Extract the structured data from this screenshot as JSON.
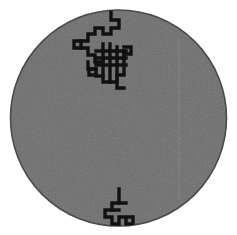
{
  "image": {
    "title": "Rectilinear trace pattern on circular gray disc",
    "width": 237,
    "height": 235,
    "background_color": "#ffffff"
  },
  "disc": {
    "name": "circular-substrate",
    "center_x": 118.5,
    "center_y": 118.0,
    "radius": 108.0,
    "fill_color": "#6e6e6e",
    "rim_color": "#4a4a4a",
    "rim_width": 1.6,
    "noise": "fine grain speckle"
  },
  "guide_line": {
    "name": "faint-vertical-guide",
    "x": 179,
    "y_top": 38,
    "y_bottom": 200,
    "color": "#8a8a8a",
    "width": 1
  },
  "traces": {
    "stroke_color": "#111111",
    "stroke_width": 3.4,
    "upper_cluster": {
      "label": "upper-trace-cluster",
      "paths": [
        "M 111 12 L 111 20 L 119 20 L 119 28 L 111 28 L 111 34 L 103 34 L 103 28 L 95 28 L 95 34 L 88 34 L 88 41 L 81 41 L 81 48 L 88 48 L 88 55 L 95 55 L 95 62 L 103 62",
        "M 74 41 L 81 41 M 74 41 L 74 48 L 81 48",
        "M 103 44 L 103 75 M 96 51 L 126 51 M 96 58 L 126 58 M 96 65 L 126 65",
        "M 110 44 L 110 72 M 117 47 L 117 78 M 124 51 L 124 62",
        "M 124 47 L 131 47 L 131 54 L 124 54",
        "M 88 62 L 88 69 L 96 69 L 96 76 L 103 76 L 103 82 L 110 82 L 110 75",
        "M 110 82 L 117 82 L 117 75 L 124 75 L 124 68",
        "M 117 82 L 117 88 L 124 88",
        "M 96 69 L 89 69 M 89 69 L 89 75 L 96 75"
      ]
    },
    "lower_cluster": {
      "label": "lower-trace-cluster",
      "paths": [
        "M 119 189 L 119 203 L 112 203 L 112 210 L 105 210 L 105 217 L 112 217 L 112 224 L 119 224 L 119 217 L 126 217 L 126 224 L 133 224 L 133 217 L 126 217",
        "M 112 210 L 119 210 M 119 203 L 126 203"
      ]
    }
  }
}
